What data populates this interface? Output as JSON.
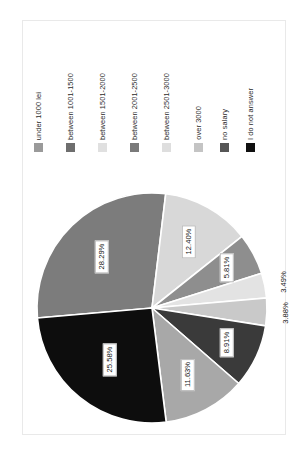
{
  "chart_data": {
    "type": "pie",
    "title": "",
    "subtitle": "",
    "xlabel": "",
    "ylabel": "",
    "legend_position": "top",
    "grid": false,
    "rotation_deg": 90,
    "value_suffix": "%",
    "categories": [
      "under 1000 lei",
      "between 1001-1500",
      "between 1501-2000",
      "between 2001-2500",
      "between 2501-3000",
      "over 3000",
      "no salary",
      "I do not answer"
    ],
    "values": [
      28.29,
      12.4,
      5.81,
      3.49,
      3.88,
      8.91,
      11.63,
      25.58
    ],
    "labels": [
      "28.29%",
      "12.40%",
      "5.81%",
      "3.49%",
      "3.88%",
      "8.91%",
      "11.63%",
      "25.58%"
    ],
    "colors": [
      "#7c7c7c",
      "#d8d8d8",
      "#8e8e8e",
      "#e3e3e3",
      "#c9c9c9",
      "#3a3a3a",
      "#a8a8a8",
      "#0d0d0d"
    ],
    "slice_edge_color": "#ffffff"
  },
  "legend": {
    "items": [
      {
        "label": "under 1000 lei",
        "color": "#9a9a9a",
        "value": "28.29%"
      },
      {
        "label": "between 1001-1500",
        "color": "#6e6e6e",
        "value": "12.40%"
      },
      {
        "label": "between 1501-2000",
        "color": "#e0e0e0",
        "value": "5.81%"
      },
      {
        "label": "between 2001-2500",
        "color": "#7a7a7a",
        "value": "3.49%"
      },
      {
        "label": "between 2501-3000",
        "color": "#dedede",
        "value": "3.88%"
      },
      {
        "label": "over 3000",
        "color": "#c4c4c4",
        "value": "8.91%"
      },
      {
        "label": "no salary",
        "color": "#565656",
        "value": "11.63%"
      },
      {
        "label": "I do not answer",
        "color": "#101010",
        "value": "25.58%"
      }
    ]
  },
  "slice_labels": [
    {
      "text": "28.29%",
      "boxed": true
    },
    {
      "text": "12.40%",
      "boxed": true
    },
    {
      "text": "5.81%",
      "boxed": true
    },
    {
      "text": "3.49%",
      "boxed": false
    },
    {
      "text": "3.88%",
      "boxed": false
    },
    {
      "text": "8.91%",
      "boxed": true
    },
    {
      "text": "11.63%",
      "boxed": true
    },
    {
      "text": "25.58%",
      "boxed": true
    }
  ]
}
